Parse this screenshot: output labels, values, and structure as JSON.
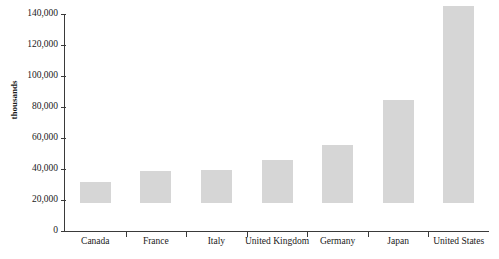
{
  "chart_data": {
    "type": "bar",
    "title": "",
    "xlabel": "",
    "ylabel": "thousands",
    "categories": [
      "Canada",
      "France",
      "Italy",
      "United Kingdom",
      "Germany",
      "Japan",
      "United States"
    ],
    "values": [
      13500,
      20600,
      21000,
      27700,
      37500,
      66500,
      127000
    ],
    "ylim": [
      0,
      140000
    ],
    "yticks": [
      0,
      20000,
      40000,
      60000,
      80000,
      100000,
      120000,
      140000
    ],
    "ytick_labels": [
      "0",
      "20,000",
      "40,000",
      "60,000",
      "80,000",
      "100,000",
      "120,000",
      "140,000"
    ],
    "grid": false,
    "legend": false,
    "bar_color": "#d6d6d6",
    "axis_color": "#3a3a3a"
  }
}
